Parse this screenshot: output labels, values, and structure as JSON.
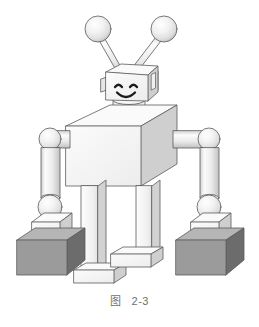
{
  "figure": {
    "caption_label": "图",
    "caption_number": "2-3",
    "caption_full": "图 2-3",
    "background_color": "#ffffff"
  },
  "palette": {
    "outline": "#5a5a5a",
    "outline_soft": "#8d8d8d",
    "face_front": "#f2f2f2",
    "face_top": "#fafafa",
    "face_right": "#cfcfcf",
    "face_right_dark": "#bdbdbd",
    "cylinder_light": "#f7f7f7",
    "cylinder_mid": "#e3e3e3",
    "cylinder_dark": "#c6c6c6",
    "sphere_light": "#fdfdfd",
    "sphere_mid": "#ececec",
    "sphere_dark": "#c9c9c9",
    "box_dark_front": "#9b9b9b",
    "box_dark_right": "#6c6c6c",
    "box_dark_top": "#b5b5b5",
    "ink": "#1b1b1b",
    "caption_text": "#6f6f6f"
  },
  "robot": {
    "name": "toy-robot",
    "parts": [
      {
        "id": "antenna-left-ball",
        "shape": "sphere",
        "label": "Left antenna ball"
      },
      {
        "id": "antenna-left-rod",
        "shape": "cylinder",
        "label": "Left antenna rod"
      },
      {
        "id": "antenna-right-ball",
        "shape": "sphere",
        "label": "Right antenna ball"
      },
      {
        "id": "antenna-right-rod",
        "shape": "cylinder",
        "label": "Right antenna rod"
      },
      {
        "id": "head",
        "shape": "cube",
        "label": "Head cube"
      },
      {
        "id": "ear-left",
        "shape": "box",
        "label": "Left ear panel"
      },
      {
        "id": "ear-right",
        "shape": "box",
        "label": "Right ear panel"
      },
      {
        "id": "eye-left",
        "shape": "arc",
        "label": "Left eye"
      },
      {
        "id": "eye-right",
        "shape": "arc",
        "label": "Right eye"
      },
      {
        "id": "mouth",
        "shape": "arc",
        "label": "Smiling mouth"
      },
      {
        "id": "neck",
        "shape": "cylinder",
        "label": "Neck cylinder"
      },
      {
        "id": "torso",
        "shape": "cube",
        "label": "Torso cube"
      },
      {
        "id": "shoulder-left",
        "shape": "cylinder",
        "label": "Left shoulder arm"
      },
      {
        "id": "shoulder-right",
        "shape": "cylinder",
        "label": "Right shoulder arm"
      },
      {
        "id": "elbow-left",
        "shape": "sphere",
        "label": "Left elbow joint"
      },
      {
        "id": "elbow-right",
        "shape": "sphere",
        "label": "Right elbow joint"
      },
      {
        "id": "forearm-left",
        "shape": "cylinder",
        "label": "Left forearm"
      },
      {
        "id": "forearm-right",
        "shape": "cylinder",
        "label": "Right forearm"
      },
      {
        "id": "hand-left",
        "shape": "sphere",
        "label": "Left hand ball"
      },
      {
        "id": "hand-right",
        "shape": "sphere",
        "label": "Right hand ball"
      },
      {
        "id": "leg-left",
        "shape": "column",
        "label": "Left leg"
      },
      {
        "id": "leg-right",
        "shape": "column",
        "label": "Right leg"
      },
      {
        "id": "foot-left",
        "shape": "box",
        "label": "Left foot"
      },
      {
        "id": "foot-right",
        "shape": "box",
        "label": "Right foot"
      },
      {
        "id": "crate-left-small",
        "shape": "box",
        "label": "Left small light crate"
      },
      {
        "id": "crate-left-large",
        "shape": "box",
        "label": "Left large dark crate"
      },
      {
        "id": "crate-right-small",
        "shape": "box",
        "label": "Right small light crate"
      },
      {
        "id": "crate-right-large",
        "shape": "box",
        "label": "Right large dark crate"
      }
    ]
  }
}
